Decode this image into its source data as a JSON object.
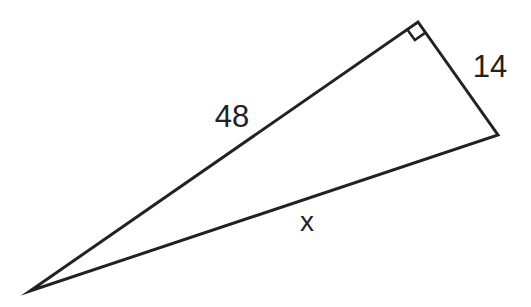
{
  "figure": {
    "type": "right-triangle",
    "background_color": "#ffffff",
    "line_color": "#222222",
    "line_width": 3,
    "triangle": {
      "vertices": {
        "bottom_left": {
          "x": 30,
          "y": 291
        },
        "top": {
          "x": 418,
          "y": 22
        },
        "right": {
          "x": 498,
          "y": 135
        }
      },
      "right_angle_marker": {
        "at_vertex": "top",
        "size": 13
      }
    },
    "side_labels": [
      {
        "side": "bottom_left-to-top",
        "text": "48",
        "x": 232,
        "y": 116,
        "font_size": 31
      },
      {
        "side": "top-to-right",
        "text": "14",
        "x": 490,
        "y": 66,
        "font_size": 31
      },
      {
        "side": "bottom_left-to-right",
        "text": "x",
        "x": 307,
        "y": 221,
        "font_size": 28
      }
    ]
  }
}
